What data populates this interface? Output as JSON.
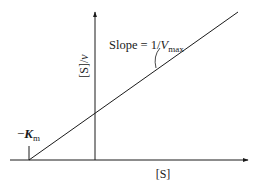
{
  "figure": {
    "type": "Lineweaver-Burk style plot ([S]/v vs [S])",
    "y_axis_label_main": "[S]/",
    "y_axis_label_var": "v",
    "x_axis_label": "[S]",
    "intercept_label_prefix": "−",
    "intercept_label_var": "K",
    "intercept_label_sub": "m",
    "slope_label_prefix": "Slope = 1/",
    "slope_label_var": "V",
    "slope_label_sub": "max",
    "colors": {
      "stroke": "#1a1a1a",
      "background": "#ffffff"
    }
  }
}
